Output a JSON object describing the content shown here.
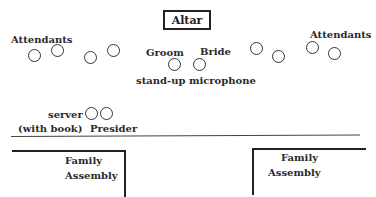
{
  "diagram": {
    "altar": "Altar",
    "attendants_left": "Attendants",
    "attendants_right": "Attendants",
    "groom": "Groom",
    "bride": "Bride",
    "microphone": "stand-up microphone",
    "server": "server",
    "with_book": "(with book)",
    "presider": "Presider",
    "family_left_1": "Family",
    "family_left_2": "Assembly",
    "family_right_1": "Family",
    "family_right_2": "Assembly"
  }
}
